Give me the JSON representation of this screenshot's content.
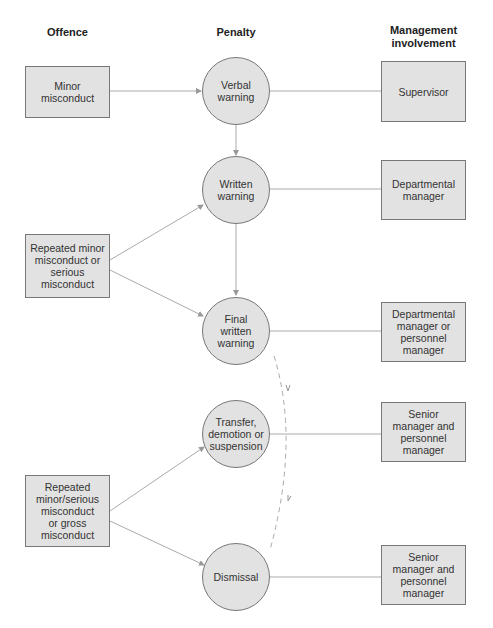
{
  "headers": {
    "offence": "Offence",
    "penalty": "Penalty",
    "management": "Management\ninvolvement"
  },
  "offences": [
    {
      "label": "Minor\nmisconduct"
    },
    {
      "label": "Repeated minor\nmisconduct or\nserious\nmisconduct"
    },
    {
      "label": "Repeated\nminor/serious\nmisconduct\nor gross\nmisconduct"
    }
  ],
  "penalties": [
    {
      "label": "Verbal\nwarning"
    },
    {
      "label": "Written\nwarning"
    },
    {
      "label": "Final\nwritten\nwarning"
    },
    {
      "label": "Transfer,\ndemotion or\nsuspension"
    },
    {
      "label": "Dismissal"
    }
  ],
  "management": [
    {
      "label": "Supervisor"
    },
    {
      "label": "Departmental\nmanager"
    },
    {
      "label": "Departmental\nmanager or\npersonnel\nmanager"
    },
    {
      "label": "Senior\nmanager and\npersonnel\nmanager"
    },
    {
      "label": "Senior\nmanager and\npersonnel\nmanager"
    }
  ],
  "colors": {
    "fill": "#e2e2e2",
    "stroke": "#777777",
    "line": "#aaaaaa"
  }
}
